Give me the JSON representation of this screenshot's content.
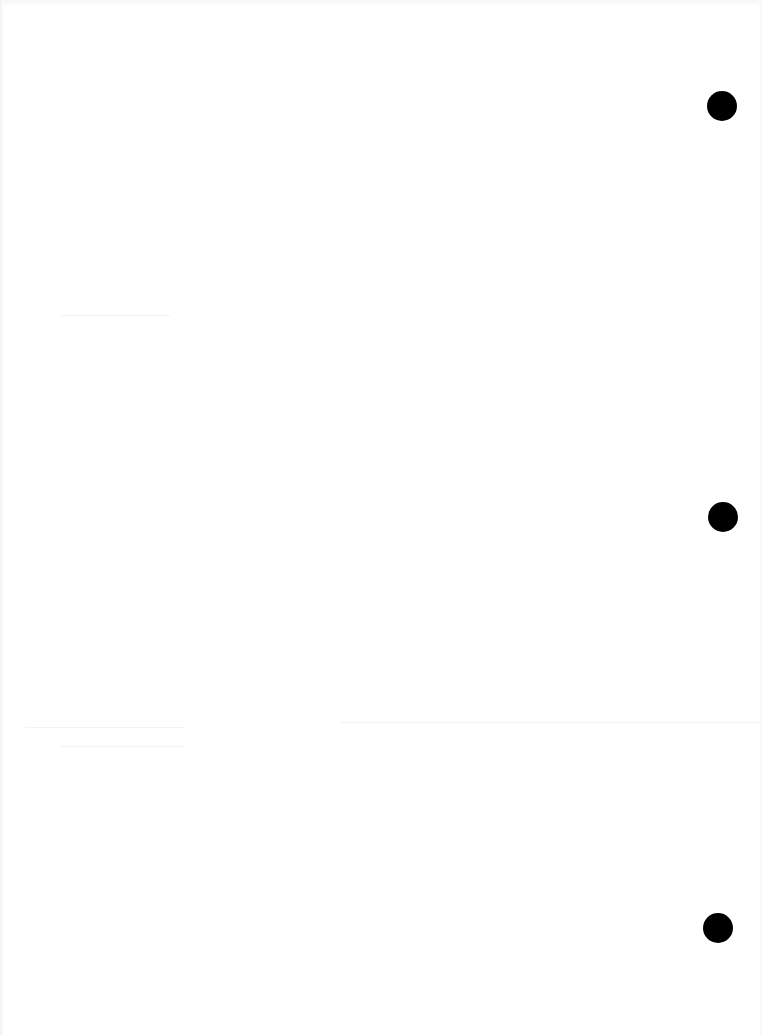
{
  "document": {
    "type": "blank scanned page",
    "text": "",
    "background_color": "#ffffff",
    "punch_holes": [
      {
        "name": "top",
        "cx": 722,
        "cy": 106,
        "d": 30,
        "color": "#000000"
      },
      {
        "name": "middle",
        "cx": 723,
        "cy": 517,
        "d": 30,
        "color": "#000000"
      },
      {
        "name": "bottom",
        "cx": 718,
        "cy": 928,
        "d": 30,
        "color": "#000000"
      }
    ]
  }
}
